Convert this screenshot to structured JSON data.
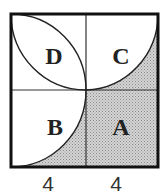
{
  "diagram": {
    "regions": [
      {
        "id": "D",
        "label": "D",
        "shaded": false
      },
      {
        "id": "C",
        "label": "C",
        "shaded": "partial"
      },
      {
        "id": "B",
        "label": "B",
        "shaded": "partial"
      },
      {
        "id": "A",
        "label": "A",
        "shaded": true
      }
    ],
    "dimensions": [
      {
        "label": "4"
      },
      {
        "label": "4"
      }
    ],
    "colors": {
      "stroke": "#222222",
      "shade": "#c8c8c8",
      "background": "#ffffff"
    }
  }
}
